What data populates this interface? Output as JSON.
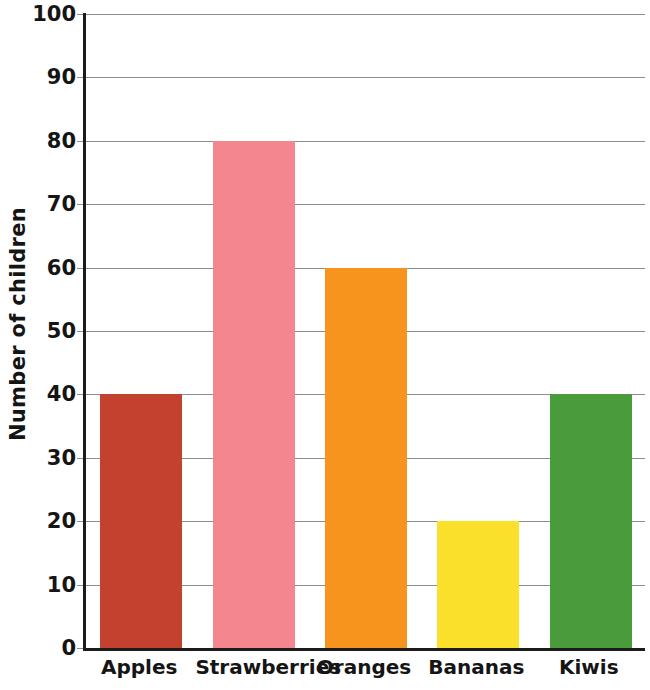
{
  "chart_data": {
    "type": "bar",
    "title": "",
    "xlabel": "",
    "ylabel": "Number of children",
    "categories": [
      "Apples",
      "Strawberries",
      "Oranges",
      "Bananas",
      "Kiwis"
    ],
    "values": [
      40,
      80,
      60,
      20,
      40
    ],
    "colors": [
      "#C4402F",
      "#F4868F",
      "#F7941E",
      "#FADF2B",
      "#4A9B3C"
    ],
    "ylim": [
      0,
      100
    ],
    "y_ticks": [
      0,
      10,
      20,
      30,
      40,
      50,
      60,
      70,
      80,
      90,
      100
    ],
    "y_tick_labels": [
      "0",
      "10",
      "20",
      "30",
      "40",
      "50",
      "60",
      "70",
      "80",
      "90",
      "100"
    ],
    "grid": true,
    "grid_axis": "y",
    "legend": false,
    "legend_position": "none",
    "bar_labels_shown": false,
    "axis_color": "#1b1b1b",
    "grid_color": "#8d8d8d",
    "background_color": "#ffffff",
    "series": [
      {
        "name": "Number of children",
        "points": [
          {
            "category": "Apples",
            "value": 40,
            "color": "#C4402F"
          },
          {
            "category": "Strawberries",
            "value": 80,
            "color": "#F4868F"
          },
          {
            "category": "Oranges",
            "value": 60,
            "color": "#F7941E"
          },
          {
            "category": "Bananas",
            "value": 20,
            "color": "#FADF2B"
          },
          {
            "category": "Kiwis",
            "value": 40,
            "color": "#4A9B3C"
          }
        ]
      }
    ]
  }
}
